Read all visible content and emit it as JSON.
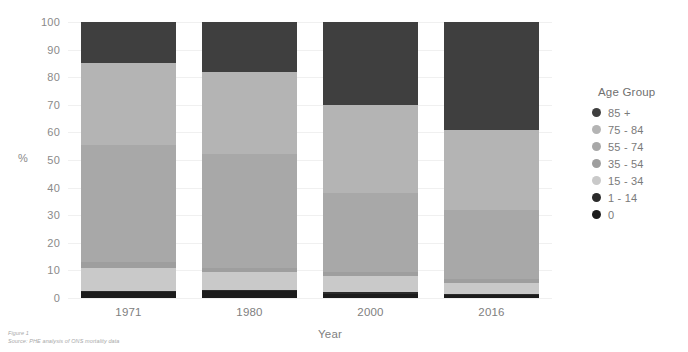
{
  "chart_data": {
    "type": "bar",
    "stacked": true,
    "title": "",
    "xlabel": "Year",
    "ylabel": "%",
    "ylim": [
      0,
      100
    ],
    "grid": true,
    "legend_position": "right",
    "legend_title": "Age Group",
    "categories": [
      "1971",
      "1980",
      "2000",
      "2016"
    ],
    "y_ticks": [
      "100",
      "90",
      "80",
      "70",
      "60",
      "50",
      "40",
      "30",
      "20",
      "10",
      "0"
    ],
    "series": [
      {
        "name": "85 +",
        "color": "#3f3f3f",
        "values": [
          15.0,
          18.0,
          30.0,
          39.0
        ]
      },
      {
        "name": "75 - 84",
        "color": "#b4b4b4",
        "values": [
          29.5,
          30.0,
          32.0,
          29.0
        ]
      },
      {
        "name": "55 - 74",
        "color": "#a8a8a8",
        "values": [
          42.5,
          41.0,
          28.5,
          25.0
        ]
      },
      {
        "name": "35 - 54",
        "color": "#9e9e9e",
        "values": [
          2.0,
          1.5,
          1.5,
          1.5
        ]
      },
      {
        "name": "15 - 34",
        "color": "#c9c9c9",
        "values": [
          8.5,
          6.5,
          6.0,
          4.0
        ]
      },
      {
        "name": "1 - 14",
        "color": "#2b2b2b",
        "values": [
          0.5,
          0.5,
          0.5,
          0.5
        ]
      },
      {
        "name": "0",
        "color": "#1c1c1c",
        "values": [
          2.0,
          2.5,
          1.5,
          1.0
        ]
      }
    ]
  },
  "footer": {
    "figure": "Figure 1",
    "source": "Source: PHE analysis of ONS mortality data"
  }
}
